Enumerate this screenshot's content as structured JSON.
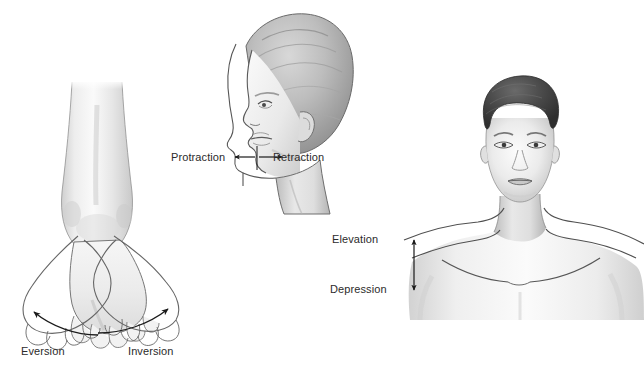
{
  "figure": {
    "background_color": "#ffffff",
    "width": 644,
    "height": 371
  },
  "panels": [
    {
      "id": "ankle-panel",
      "name": "eversion-inversion-panel",
      "subject": "anterior view of lower leg, ankle and foot with overlapping foot outlines",
      "labels": [
        {
          "key": "eversion",
          "text": "Eversion"
        },
        {
          "key": "inversion",
          "text": "Inversion"
        }
      ],
      "arrows": [
        {
          "name": "eversion-curved-arrow",
          "type": "curved",
          "direction": "up-left"
        },
        {
          "name": "inversion-curved-arrow",
          "type": "curved",
          "direction": "up-right"
        }
      ]
    },
    {
      "id": "jaw-panel",
      "name": "protraction-retraction-panel",
      "subject": "lateral profile view of a head showing mandible protracted and retracted",
      "labels": [
        {
          "key": "protraction",
          "text": "Protraction"
        },
        {
          "key": "retraction",
          "text": "Retraction"
        }
      ],
      "arrows": [
        {
          "name": "protraction-arrow",
          "type": "straight",
          "direction": "left"
        },
        {
          "name": "retraction-arrow",
          "type": "straight",
          "direction": "right"
        }
      ]
    },
    {
      "id": "shoulder-panel",
      "name": "elevation-depression-panel",
      "subject": "anterior view of head, neck and shoulders showing elevated and depressed shoulder contours",
      "labels": [
        {
          "key": "elevation",
          "text": "Elevation"
        },
        {
          "key": "depression",
          "text": "Depression"
        }
      ],
      "arrows": [
        {
          "name": "elevation-depression-arrow",
          "type": "double-headed",
          "direction": "vertical"
        }
      ]
    }
  ],
  "labels": {
    "eversion": "Eversion",
    "inversion": "Inversion",
    "protraction": "Protraction",
    "retraction": "Retraction",
    "elevation": "Elevation",
    "depression": "Depression"
  },
  "colors": {
    "background": "#ffffff",
    "label_text": "#2b2b2b",
    "outline": "#4a4a4a",
    "arrow": "#1a1a1a",
    "skin_light": "#f2f2f2",
    "skin_mid": "#d9d9d9",
    "skin_shadow": "#b8b8b8",
    "hair_dark": "#3a3a3a"
  }
}
